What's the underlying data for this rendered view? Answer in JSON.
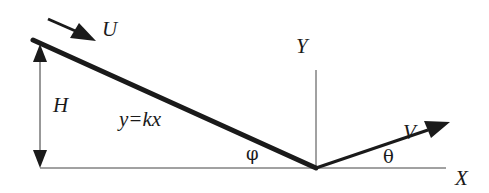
{
  "diagram": {
    "labels": {
      "U": "U",
      "H": "H",
      "Y": "Y",
      "V": "V",
      "X": "X",
      "slope_eq": "y=kx",
      "phi": "φ",
      "theta": "θ"
    },
    "colors": {
      "line": "#1a1a1a",
      "axis": "#444444",
      "background": "#ffffff"
    },
    "elements": [
      "incline-line y=kx",
      "incoming-velocity-arrow U",
      "height-dimension-arrow H",
      "y-axis Y",
      "x-axis X",
      "outgoing-velocity-arrow V",
      "angle phi",
      "angle theta"
    ]
  }
}
